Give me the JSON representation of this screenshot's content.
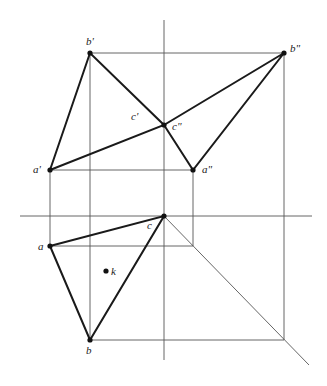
{
  "diagram": {
    "type": "orthographic-projection",
    "colors": {
      "construction": "#555555",
      "edge": "#1a1a1a",
      "point": "#111111",
      "background": "#ffffff"
    },
    "labels": {
      "b_front": "b'",
      "c_front": "c'",
      "a_front": "a'",
      "b_side": "b\"",
      "c_side": "c\"",
      "a_side": "a\"",
      "a_top": "a",
      "c_top": "c",
      "k_top": "k",
      "b_top": "b"
    }
  }
}
